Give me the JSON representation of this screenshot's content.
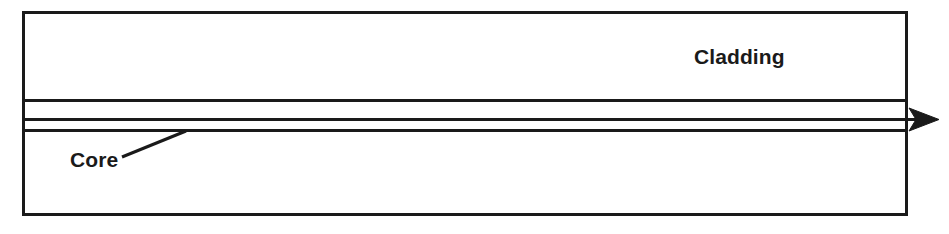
{
  "figure": {
    "name": "optical-fiber-cross-section",
    "type": "technical-diagram",
    "background_color": "#ffffff",
    "line_color": "#1a1a1a",
    "text_color": "#1a1a1a"
  },
  "labels": {
    "cladding": "Cladding",
    "core": "Core"
  },
  "geometry": {
    "outer_rect": {
      "x": 22,
      "y": 11,
      "width": 886,
      "height": 205,
      "stroke_width": 3
    },
    "core_top_line": {
      "x1": 22,
      "y1": 100,
      "x2": 908,
      "y2": 100,
      "stroke_width": 3
    },
    "core_bottom_line": {
      "x1": 22,
      "y1": 130,
      "x2": 908,
      "y2": 130,
      "stroke_width": 3
    },
    "ray_line": {
      "x1": 22,
      "y1": 119,
      "x2": 930,
      "y2": 119,
      "stroke_width": 3
    },
    "arrow_tip": {
      "x": 937,
      "y": 119
    },
    "core_leader_line": {
      "x1": 122,
      "y1": 157,
      "x2": 186,
      "y2": 131,
      "stroke_width": 3
    }
  },
  "icons": {
    "ray_arrow": "arrow-right-icon"
  }
}
